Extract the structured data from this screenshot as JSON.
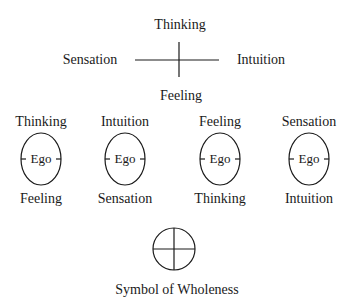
{
  "cross": {
    "top": "Thinking",
    "left": "Sensation",
    "right": "Intuition",
    "bottom": "Feeling"
  },
  "egos": [
    {
      "top": "Thinking",
      "center": "Ego",
      "bottom": "Feeling"
    },
    {
      "top": "Intuition",
      "center": "Ego",
      "bottom": "Sensation"
    },
    {
      "top": "Feeling",
      "center": "Ego",
      "bottom": "Thinking"
    },
    {
      "top": "Sensation",
      "center": "Ego",
      "bottom": "Intuition"
    }
  ],
  "wholeness": {
    "label": "Symbol of Wholeness",
    "icon": "circle-cross-icon"
  },
  "colors": {
    "ink": "#1a1a1a",
    "background": "#ffffff"
  }
}
